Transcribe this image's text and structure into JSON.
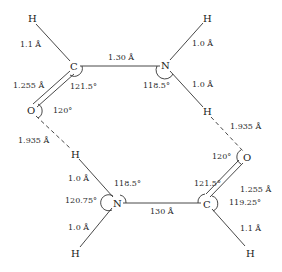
{
  "diagram": {
    "atoms": {
      "h1": "H",
      "c1": "C",
      "n1": "N",
      "h2": "H",
      "h3": "H",
      "o1": "O",
      "h4": "H",
      "n2": "N",
      "h5": "H",
      "o2": "O",
      "c2": "C",
      "h6": "H"
    },
    "bond_lengths": {
      "c1_h1": "1.1 Å",
      "c1_n1": "1.30 Å",
      "n1_h2": "1.0 Å",
      "n1_h3": "1.0 Å",
      "c1_o1": "1.255 Å",
      "h3_o2": "1.935 Å",
      "o1_h4": "1.935 Å",
      "n2_h4": "1.0 Å",
      "n2_h5": "1.0 Å",
      "n2_c2": "130 Å",
      "c2_o2": "1.255 Å",
      "c2_h6": "1.1 Å"
    },
    "angles": {
      "c1": "121.5°",
      "n1": "118.5°",
      "o1": "120°",
      "n2_top": "118.5°",
      "n2_left": "120.75°",
      "o2": "120°",
      "c2_top": "121.5°",
      "c2_right": "119.25°"
    }
  }
}
